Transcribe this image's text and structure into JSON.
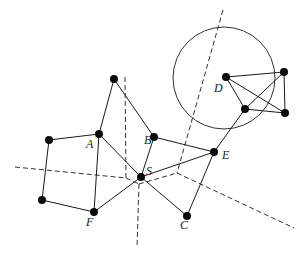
{
  "diagram": {
    "type": "network-graph-with-voronoi-partition",
    "colors": {
      "edge": "#1a1a1a",
      "node": "#0a0a0a",
      "dashed": "#333333",
      "background": "#ffffff"
    },
    "nodes": [
      {
        "id": "top",
        "label": "",
        "x": 114,
        "y": 79
      },
      {
        "id": "A",
        "label": "A",
        "x": 99,
        "y": 134,
        "lx": 86,
        "ly": 148
      },
      {
        "id": "B",
        "label": "B",
        "x": 154,
        "y": 137,
        "lx": 144,
        "ly": 144
      },
      {
        "id": "S",
        "label": "S",
        "x": 141,
        "y": 177,
        "lx": 146,
        "ly": 175
      },
      {
        "id": "E",
        "label": "E",
        "x": 214,
        "y": 152,
        "lx": 222,
        "ly": 159
      },
      {
        "id": "C",
        "label": "C",
        "x": 187,
        "y": 216,
        "lx": 180,
        "ly": 229
      },
      {
        "id": "F",
        "label": "F",
        "x": 94,
        "y": 212,
        "lx": 86,
        "ly": 226
      },
      {
        "id": "L1",
        "label": "",
        "x": 49,
        "y": 140
      },
      {
        "id": "L2",
        "label": "",
        "x": 42,
        "y": 200
      },
      {
        "id": "D",
        "label": "D",
        "x": 226,
        "y": 77,
        "lx": 214,
        "ly": 92
      },
      {
        "id": "D2",
        "label": "",
        "x": 284,
        "y": 72
      },
      {
        "id": "D3",
        "label": "",
        "x": 245,
        "y": 109
      },
      {
        "id": "D4",
        "label": "",
        "x": 285,
        "y": 113
      }
    ],
    "edges": [
      [
        "top",
        "A"
      ],
      [
        "top",
        "B"
      ],
      [
        "L1",
        "A"
      ],
      [
        "L1",
        "L2"
      ],
      [
        "L2",
        "F"
      ],
      [
        "A",
        "F"
      ],
      [
        "A",
        "S"
      ],
      [
        "B",
        "S"
      ],
      [
        "B",
        "E"
      ],
      [
        "S",
        "E"
      ],
      [
        "S",
        "C"
      ],
      [
        "S",
        "F"
      ],
      [
        "E",
        "C"
      ],
      [
        "E",
        "D3"
      ],
      [
        "D",
        "D2"
      ],
      [
        "D",
        "D3"
      ],
      [
        "D",
        "D4"
      ],
      [
        "D2",
        "D3"
      ],
      [
        "D2",
        "D4"
      ],
      [
        "D3",
        "D4"
      ]
    ],
    "dashed_lines": [
      {
        "x1": 125,
        "y1": 77,
        "x2": 126,
        "y2": 178
      },
      {
        "x1": 15,
        "y1": 167,
        "x2": 126,
        "y2": 178
      },
      {
        "x1": 126,
        "y1": 178,
        "x2": 139,
        "y2": 184
      },
      {
        "x1": 139,
        "y1": 184,
        "x2": 137,
        "y2": 248
      },
      {
        "x1": 139,
        "y1": 184,
        "x2": 177,
        "y2": 173
      },
      {
        "x1": 223,
        "y1": 10,
        "x2": 177,
        "y2": 173
      },
      {
        "x1": 177,
        "y1": 173,
        "x2": 294,
        "y2": 228
      }
    ],
    "circle": {
      "cx": 224,
      "cy": 78,
      "r": 51
    }
  }
}
